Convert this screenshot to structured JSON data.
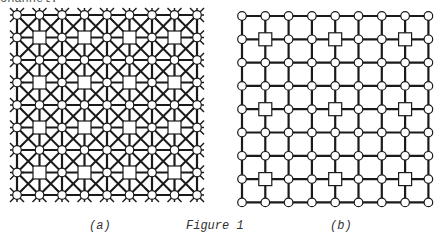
{
  "top_text_fragment": "channel.",
  "figure": {
    "caption": "Figure 1",
    "panels": [
      {
        "id": "a",
        "label": "(a)",
        "grid_size": 9,
        "x0": 17,
        "y0": 15,
        "step": 22.5,
        "diagonals": true,
        "square_nodes": [
          [
            1,
            1
          ],
          [
            3,
            1
          ],
          [
            5,
            1
          ],
          [
            7,
            1
          ],
          [
            1,
            3
          ],
          [
            3,
            3
          ],
          [
            5,
            3
          ],
          [
            7,
            3
          ],
          [
            1,
            5
          ],
          [
            3,
            5
          ],
          [
            5,
            5
          ],
          [
            7,
            5
          ],
          [
            1,
            7
          ],
          [
            3,
            7
          ],
          [
            5,
            7
          ],
          [
            7,
            7
          ]
        ],
        "border_spikes": true
      },
      {
        "id": "b",
        "label": "(b)",
        "grid_size": 9,
        "x0": 242,
        "y0": 16,
        "step": 23.3,
        "diagonals": false,
        "square_nodes": [
          [
            1,
            1
          ],
          [
            4,
            1
          ],
          [
            7,
            1
          ],
          [
            1,
            4
          ],
          [
            4,
            4
          ],
          [
            7,
            4
          ],
          [
            1,
            7
          ],
          [
            4,
            7
          ],
          [
            7,
            7
          ]
        ],
        "border_spikes": false
      }
    ]
  },
  "colors": {
    "line": "#1a1a1a",
    "node_fill": "#ffffff",
    "text": "#333333"
  }
}
